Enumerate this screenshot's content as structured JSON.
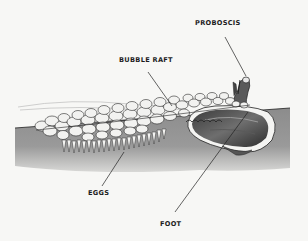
{
  "figure": {
    "colors": {
      "background": "#f7f7f5",
      "water": "#8f8f8f",
      "water_light": "#b9b9b9",
      "bubble_fill": "#f2f2f0",
      "outline": "#222222",
      "shell_dark": "#4a4a4a",
      "shell_mid": "#7a7a7a"
    }
  },
  "labels": {
    "proboscis": "PROBOSCIS",
    "bubble_raft": "BUBBLE RAFT",
    "eggs": "EGGS",
    "foot": "FOOT"
  }
}
